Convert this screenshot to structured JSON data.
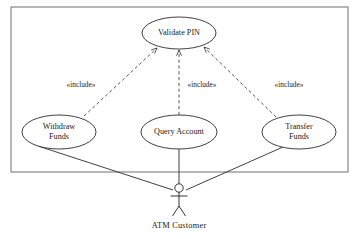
{
  "diagram": {
    "type": "uml-use-case-diagram",
    "background_color": "#ffffff",
    "line_color": "#2b2b2b",
    "boundary_color": "#7d7d7d",
    "system_boundary": {
      "name": "system-boundary",
      "x": 11,
      "y": 7,
      "width": 337,
      "height": 165,
      "label": ""
    },
    "use_cases": [
      {
        "id": "validate-pin",
        "lines": [
          "Validate PIN"
        ],
        "cx": 179,
        "cy": 33,
        "rx": 37,
        "ry": 16
      },
      {
        "id": "withdraw-funds",
        "lines": [
          "Withdraw",
          "Funds"
        ],
        "cx": 59,
        "cy": 132,
        "rx": 37,
        "ry": 17
      },
      {
        "id": "query-account",
        "lines": [
          "Query Account"
        ],
        "cx": 179,
        "cy": 132,
        "rx": 38,
        "ry": 17
      },
      {
        "id": "transfer-funds",
        "lines": [
          "Transfer",
          "Funds"
        ],
        "cx": 299,
        "cy": 132,
        "rx": 37,
        "ry": 17
      }
    ],
    "include_relationships": [
      {
        "id": "include-withdraw",
        "label": "«include»",
        "from": "withdraw-funds",
        "to": "validate-pin",
        "x1": 84,
        "y1": 116,
        "x2": 157,
        "y2": 48,
        "label_x": 81,
        "label_y": 85
      },
      {
        "id": "include-query",
        "label": "«include»",
        "from": "query-account",
        "to": "validate-pin",
        "x1": 179,
        "y1": 115,
        "x2": 179,
        "y2": 50,
        "label_x": 202,
        "label_y": 85
      },
      {
        "id": "include-transfer",
        "label": "«include»",
        "from": "transfer-funds",
        "to": "validate-pin",
        "x1": 276,
        "y1": 117,
        "x2": 204,
        "y2": 47,
        "label_x": 289,
        "label_y": 85
      }
    ],
    "associations": [
      {
        "id": "assoc-withdraw-actor",
        "from": "withdraw-funds",
        "to": "atm-customer",
        "x1": 38,
        "y1": 146,
        "x2": 173,
        "y2": 190
      },
      {
        "id": "assoc-query-actor",
        "from": "query-account",
        "to": "atm-customer",
        "x1": 179,
        "y1": 149,
        "x2": 179,
        "y2": 184
      },
      {
        "id": "assoc-transfer-actor",
        "from": "transfer-funds",
        "to": "atm-customer",
        "x1": 283,
        "y1": 147,
        "x2": 186,
        "y2": 190
      }
    ],
    "actor": {
      "id": "atm-customer",
      "label": "ATM  Customer",
      "cx": 179,
      "head_cy": 188,
      "head_r": 4.2,
      "body_top": 192,
      "body_bottom": 206,
      "arm_y": 196,
      "arm_half_width": 8.5,
      "leg_bottom": 216,
      "leg_half_width": 6.5,
      "label_x": 179,
      "label_y": 226
    }
  }
}
